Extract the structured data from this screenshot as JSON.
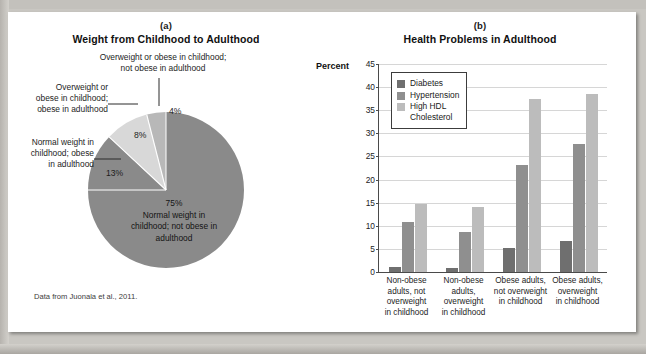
{
  "figure": {
    "background_color": "#ffffff",
    "page_color": "#c9c7c2"
  },
  "panel_a": {
    "tag": "(a)",
    "title": "Weight from Childhood to Adulthood",
    "source_note": "Data from Juonala et al., 2011.",
    "callouts": {
      "top": "Overweight or obese in childhood;\nnot obese in adulthood",
      "top_line1": "Overweight or obese in childhood;",
      "top_line2": "not obese in adulthood",
      "upper_left": "Overweight or\nobese in childhood;\nobese in adulthood",
      "upper_left_l1": "Overweight or",
      "upper_left_l2": "obese in childhood;",
      "upper_left_l3": "obese in adulthood",
      "left": "Normal weight in\nchildhood; obese\nin adulthood",
      "left_l1": "Normal weight in",
      "left_l2": "childhood; obese",
      "left_l3": "in adulthood",
      "center_l1": "75%",
      "center_l2": "Normal weight in",
      "center_l3": "childhood; not obese in",
      "center_l4": "adulthood"
    },
    "slice_labels": {
      "four": "4%",
      "eight": "8%",
      "thirteen": "13%"
    }
  },
  "panel_b": {
    "tag": "(b)",
    "title": "Health Problems in Adulthood",
    "axis_label": "Percent"
  },
  "chart_data": [
    {
      "type": "pie",
      "title": "Weight from Childhood to Adulthood",
      "labels": [
        "Normal weight in childhood; not obese in adulthood",
        "Normal weight in childhood; obese in adulthood",
        "Overweight or obese in childhood; obese in adulthood",
        "Overweight or obese in childhood; not obese in adulthood"
      ],
      "values": [
        75,
        13,
        8,
        4
      ],
      "value_labels": [
        "75%",
        "13%",
        "8%",
        "4%"
      ],
      "colors": [
        "#8a8a8a",
        "#8a8a8a",
        "#d5d5d5",
        "#b5b5b5"
      ],
      "source": "Data from Juonala et al., 2011."
    },
    {
      "type": "bar",
      "title": "Health Problems in Adulthood",
      "ylabel": "Percent",
      "xlabel": "",
      "ylim": [
        0,
        45
      ],
      "ytick_step": 5,
      "yticks": [
        0,
        5,
        10,
        15,
        20,
        25,
        30,
        35,
        40,
        45
      ],
      "grid": true,
      "legend_position": "upper-left",
      "categories": [
        "Non-obese adults, not overweight in childhood",
        "Non-obese adults, overweight in childhood",
        "Obese adults, not overweight in childhood",
        "Obese adults, overweight in childhood"
      ],
      "category_lines": [
        [
          "Non-obese",
          "adults, not",
          "overweight",
          "in childhood"
        ],
        [
          "Non-obese",
          "adults,",
          "overweight",
          "in childhood"
        ],
        [
          "Obese adults,",
          "not overweight",
          "in childhood"
        ],
        [
          "Obese adults,",
          "overweight",
          "in childhood"
        ]
      ],
      "series": [
        {
          "name": "Diabetes",
          "color": "#6f6f6f",
          "values": [
            1.0,
            0.8,
            5.2,
            6.8
          ]
        },
        {
          "name": "Hypertension",
          "color": "#8f8f8f",
          "values": [
            10.8,
            8.6,
            23.2,
            27.8
          ]
        },
        {
          "name": "High HDL Cholesterol",
          "color": "#bcbcbc",
          "values": [
            14.7,
            14.0,
            37.5,
            38.5
          ]
        }
      ],
      "legend_entries": [
        {
          "label": "Diabetes",
          "color": "#6f6f6f"
        },
        {
          "label": "Hypertension",
          "color": "#8f8f8f"
        },
        {
          "label": "High HDL\nCholesterol",
          "color": "#bcbcbc"
        }
      ]
    }
  ]
}
